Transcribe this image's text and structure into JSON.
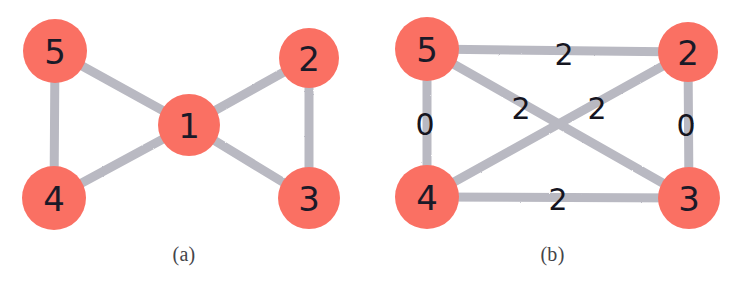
{
  "figure": {
    "background_color": "#ffffff",
    "node_color": "#fa7064",
    "edge_color": "#b9b9c2",
    "node_label_color": "#1a1a28",
    "edge_label_color": "#15151f",
    "caption_color": "#444449"
  },
  "panels": [
    {
      "id": "a",
      "caption": "(a)",
      "nodes": [
        {
          "id": "5",
          "label": "5",
          "cx": 55,
          "cy": 51,
          "r": 32
        },
        {
          "id": "2",
          "label": "2",
          "cx": 309,
          "cy": 58,
          "r": 30
        },
        {
          "id": "1",
          "label": "1",
          "cx": 189,
          "cy": 125,
          "r": 31
        },
        {
          "id": "4",
          "label": "4",
          "cx": 54,
          "cy": 198,
          "r": 32
        },
        {
          "id": "3",
          "label": "3",
          "cx": 309,
          "cy": 198,
          "r": 31
        }
      ],
      "edges": [
        {
          "from": "5",
          "to": "4",
          "label": ""
        },
        {
          "from": "5",
          "to": "1",
          "label": ""
        },
        {
          "from": "4",
          "to": "1",
          "label": ""
        },
        {
          "from": "1",
          "to": "2",
          "label": ""
        },
        {
          "from": "1",
          "to": "3",
          "label": ""
        },
        {
          "from": "2",
          "to": "3",
          "label": ""
        }
      ]
    },
    {
      "id": "b",
      "caption": "(b)",
      "nodes": [
        {
          "id": "5",
          "label": "5",
          "cx": 59,
          "cy": 49,
          "r": 32
        },
        {
          "id": "2",
          "label": "2",
          "cx": 320,
          "cy": 52,
          "r": 30
        },
        {
          "id": "4",
          "label": "4",
          "cx": 59,
          "cy": 197,
          "r": 32
        },
        {
          "id": "3",
          "label": "3",
          "cx": 321,
          "cy": 198,
          "r": 31
        }
      ],
      "edges": [
        {
          "from": "5",
          "to": "2",
          "label": "2",
          "lx": 196,
          "ly": 54
        },
        {
          "from": "5",
          "to": "4",
          "label": "0",
          "lx": 57,
          "ly": 124
        },
        {
          "from": "2",
          "to": "3",
          "label": "0",
          "lx": 318,
          "ly": 125
        },
        {
          "from": "4",
          "to": "3",
          "label": "2",
          "lx": 190,
          "ly": 199
        },
        {
          "from": "5",
          "to": "3",
          "label": "2",
          "lx": 153,
          "ly": 108
        },
        {
          "from": "4",
          "to": "2",
          "label": "2",
          "lx": 229,
          "ly": 108
        }
      ]
    }
  ]
}
